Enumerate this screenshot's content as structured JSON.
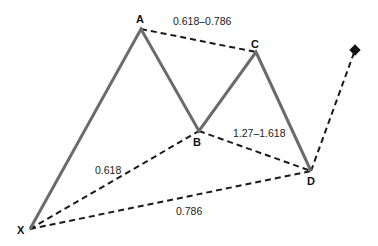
{
  "diagram": {
    "type": "harmonic-pattern",
    "colors": {
      "solid_leg": "#6b6b6b",
      "dashed": "#1a1a1a",
      "text": "#111111",
      "background": "#ffffff"
    },
    "points": {
      "X": {
        "label": "X",
        "x": 30,
        "y": 229
      },
      "A": {
        "label": "A",
        "x": 141,
        "y": 29
      },
      "B": {
        "label": "B",
        "x": 199,
        "y": 131
      },
      "C": {
        "label": "C",
        "x": 256,
        "y": 52
      },
      "D": {
        "label": "D",
        "x": 311,
        "y": 171
      },
      "T": {
        "label": "",
        "x": 355,
        "y": 50
      }
    },
    "ratios": {
      "AC": "0.618–0.786",
      "XB": "0.618",
      "BD": "1.27–1.618",
      "XD": "0.786"
    }
  }
}
